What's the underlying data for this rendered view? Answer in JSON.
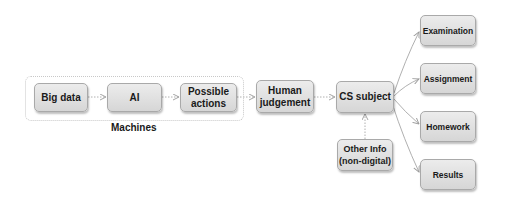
{
  "diagram": {
    "group": {
      "label": "Machines"
    },
    "nodes": {
      "big_data": "Big data",
      "ai": "AI",
      "possible_actions": "Possible actions",
      "human_judgement": "Human judgement",
      "cs_subject": "CS subject",
      "other_info": "Other Info (non-digital)",
      "examination": "Examination",
      "assignment": "Assignment",
      "homework": "Homework",
      "results": "Results"
    },
    "edges": [
      {
        "from": "Big data",
        "to": "AI",
        "style": "dotted"
      },
      {
        "from": "AI",
        "to": "Possible actions",
        "style": "dotted"
      },
      {
        "from": "Possible actions",
        "to": "Human judgement",
        "style": "dotted"
      },
      {
        "from": "Human judgement",
        "to": "CS subject",
        "style": "dotted"
      },
      {
        "from": "Other Info (non-digital)",
        "to": "CS subject",
        "style": "dotted"
      },
      {
        "from": "CS subject",
        "to": "Examination",
        "style": "solid"
      },
      {
        "from": "CS subject",
        "to": "Assignment",
        "style": "solid"
      },
      {
        "from": "CS subject",
        "to": "Homework",
        "style": "solid"
      },
      {
        "from": "CS subject",
        "to": "Results",
        "style": "solid"
      }
    ],
    "colors": {
      "box_top": "#ececec",
      "box_bottom": "#d6d6d6",
      "border": "#a9a9a9",
      "line": "#b0b0b0"
    }
  }
}
